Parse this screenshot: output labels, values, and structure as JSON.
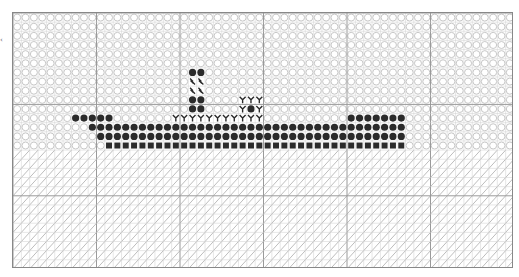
{
  "pattern": {
    "title": "",
    "cols": 60,
    "rows": 28,
    "cell_w": 8.35,
    "cell_h": 9.14,
    "major_every": 10,
    "sky_rows": 15,
    "colors": {
      "background": "#ffffff",
      "minor_grid": "#cfcfcf",
      "major_grid": "#9a9a9a",
      "border": "#888888",
      "sky_circle": "#c8c8c8",
      "water_hatch": "#b5b5b5",
      "stitch_dark": "#2b2b2b"
    },
    "symbols": {
      "sky": "open-circle",
      "water": "diagonal-hatch",
      "hull": "filled-circle",
      "waterline": "filled-square",
      "window": "double-slash",
      "rigging": "y-glyph"
    },
    "stitches": [
      {
        "type": "filled-circle",
        "row": 6,
        "cols": [
          21,
          22
        ]
      },
      {
        "type": "double-slash",
        "row": 7,
        "cols": [
          21,
          22
        ]
      },
      {
        "type": "double-slash",
        "row": 8,
        "cols": [
          21,
          22
        ]
      },
      {
        "type": "filled-circle",
        "row": 9,
        "cols": [
          21,
          22
        ]
      },
      {
        "type": "y-glyph",
        "row": 9,
        "cols": [
          27,
          28,
          29
        ]
      },
      {
        "type": "filled-circle",
        "row": 10,
        "cols": [
          21,
          22,
          28
        ]
      },
      {
        "type": "y-glyph",
        "row": 10,
        "cols": [
          27,
          29
        ]
      },
      {
        "type": "filled-circle",
        "row": 11,
        "cols": [
          7,
          8,
          9,
          10,
          11,
          40,
          41,
          42,
          43,
          44,
          45,
          46
        ]
      },
      {
        "type": "y-glyph",
        "row": 11,
        "cols": [
          19,
          20,
          21,
          22,
          23,
          24,
          25,
          26,
          27,
          28,
          29
        ]
      },
      {
        "type": "filled-circle",
        "row": 12,
        "range": [
          9,
          46
        ]
      },
      {
        "type": "filled-circle",
        "row": 13,
        "range": [
          10,
          46
        ]
      },
      {
        "type": "filled-square",
        "row": 14,
        "range": [
          11,
          46
        ]
      }
    ]
  },
  "side_marker": "‹"
}
